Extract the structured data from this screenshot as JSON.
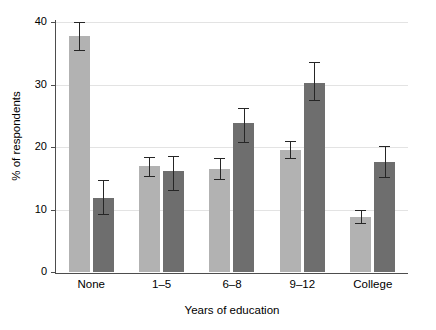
{
  "chart_data": {
    "type": "bar",
    "title": "",
    "xlabel": "Years of education",
    "ylabel": "% of respondents",
    "categories": [
      "None",
      "1–5",
      "6–8",
      "9–12",
      "College"
    ],
    "ylim": [
      0,
      40
    ],
    "yticks": [
      0,
      10,
      20,
      30,
      40
    ],
    "grid": "horizontal",
    "legend": "none",
    "series": [
      {
        "name": "series-1",
        "color": "#b2b2b2",
        "values": [
          37.7,
          16.9,
          16.5,
          19.5,
          8.8
        ],
        "err_low": [
          35.6,
          15.4,
          14.9,
          18.2,
          7.8
        ],
        "err_high": [
          40.0,
          18.4,
          18.2,
          21.0,
          9.9
        ]
      },
      {
        "name": "series-2",
        "color": "#6e6e6e",
        "values": [
          11.8,
          16.1,
          23.8,
          30.2,
          17.6
        ],
        "err_low": [
          9.3,
          13.2,
          20.8,
          27.6,
          15.2
        ],
        "err_high": [
          14.7,
          18.6,
          26.3,
          33.6,
          20.2
        ]
      }
    ]
  },
  "axes": {
    "y_tick_labels": [
      "0",
      "10",
      "20",
      "30",
      "40"
    ],
    "x_tick_labels": [
      "None",
      "1–5",
      "6–8",
      "9–12",
      "College"
    ],
    "y_title": "% of respondents",
    "x_title": "Years of education"
  },
  "colors": {
    "bar_light": "#b2b2b2",
    "bar_dark": "#6e6e6e",
    "axis": "#4d4d4d",
    "grid": "#e3e3e3",
    "error": "#262626",
    "background": "#ffffff"
  }
}
